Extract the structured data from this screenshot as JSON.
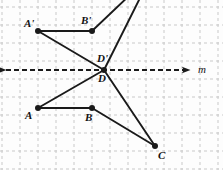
{
  "figure": {
    "kind": "geometry-reflection-diagram",
    "width": 223,
    "height": 170,
    "background_color": "#fdfdfd",
    "stroke_color": "#1a1a1a",
    "grid": {
      "visible": true,
      "style": "dashed",
      "color": "#c9c9c9",
      "spacing": 18,
      "origin_x": 2,
      "origin_y": 7
    },
    "mirror_line": {
      "name": "m",
      "label": "m",
      "label_x": 198,
      "label_y": 64,
      "y": 70,
      "x_start": 6,
      "x_end": 190,
      "style": "dashed",
      "arrows": "both",
      "color": "#1a1a1a"
    },
    "points": [
      {
        "id": "A-prime",
        "label": "A'",
        "x": 38,
        "y": 31,
        "label_x": 24,
        "label_y": 18,
        "dot": true
      },
      {
        "id": "B-prime",
        "label": "B'",
        "x": 92,
        "y": 31,
        "label_x": 81,
        "label_y": 15,
        "dot": true
      },
      {
        "id": "D-prime",
        "label": "D'",
        "x": 104,
        "y": 70,
        "label_x": 97,
        "label_y": 53,
        "dot": true
      },
      {
        "id": "D",
        "label": "D",
        "x": 104,
        "y": 70,
        "label_x": 98,
        "label_y": 73,
        "dot": false
      },
      {
        "id": "A",
        "label": "A",
        "x": 38,
        "y": 108,
        "label_x": 25,
        "label_y": 110,
        "dot": true
      },
      {
        "id": "B",
        "label": "B",
        "x": 92,
        "y": 108,
        "label_x": 85,
        "label_y": 112,
        "dot": true
      },
      {
        "id": "C",
        "label": "C",
        "x": 155,
        "y": 146,
        "label_x": 158,
        "label_y": 150,
        "dot": true
      },
      {
        "id": "C-prime",
        "label": "",
        "x": 152,
        "y": -26,
        "label_x": 0,
        "label_y": 0,
        "dot": false
      }
    ],
    "segments": [
      {
        "id": "seg-A-prime-B-prime",
        "from": "A-prime",
        "to": "B-prime"
      },
      {
        "id": "seg-A-prime-D-prime",
        "from": "A-prime",
        "to": "D-prime"
      },
      {
        "id": "seg-B-prime-C-prime",
        "from": "B-prime",
        "to": "C-prime"
      },
      {
        "id": "seg-D-prime-C-prime",
        "from": "D-prime",
        "to": "C-prime"
      },
      {
        "id": "seg-A-B",
        "from": "A",
        "to": "B"
      },
      {
        "id": "seg-A-D",
        "from": "A",
        "to": "D"
      },
      {
        "id": "seg-B-C",
        "from": "B",
        "to": "C"
      },
      {
        "id": "seg-D-C",
        "from": "D",
        "to": "C"
      }
    ]
  }
}
